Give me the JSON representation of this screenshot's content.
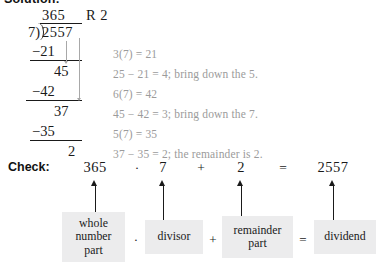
{
  "heading": "Solution:",
  "long_division": {
    "quotient": "365",
    "remainder_tag": "R 2",
    "divisor": "7)",
    "dividend": "2557",
    "steps": [
      {
        "subtract": "−21",
        "partial": "45"
      },
      {
        "subtract": "−42",
        "partial": "37"
      },
      {
        "subtract": "−35",
        "partial": "2"
      }
    ]
  },
  "annotations": [
    "3(7) = 21",
    "25 − 21 = 4; bring down the 5.",
    "6(7) = 42",
    "45 − 42 = 3; bring down the 7.",
    "5(7) = 35",
    "37 − 35 = 2; the remainder is 2."
  ],
  "check": {
    "label": "Check:",
    "terms": [
      "365",
      "7",
      "2",
      "2557"
    ],
    "operators": [
      "·",
      "+",
      "="
    ]
  },
  "term_boxes": {
    "labels": [
      "whole\nnumber\npart",
      "divisor",
      "remainder\npart",
      "dividend"
    ],
    "operators": [
      "·",
      "+",
      "="
    ],
    "fill_color": "#ececed"
  },
  "colors": {
    "text": "#1a1a1a",
    "annotation": "#9b9b9b",
    "background": "#ffffff"
  }
}
